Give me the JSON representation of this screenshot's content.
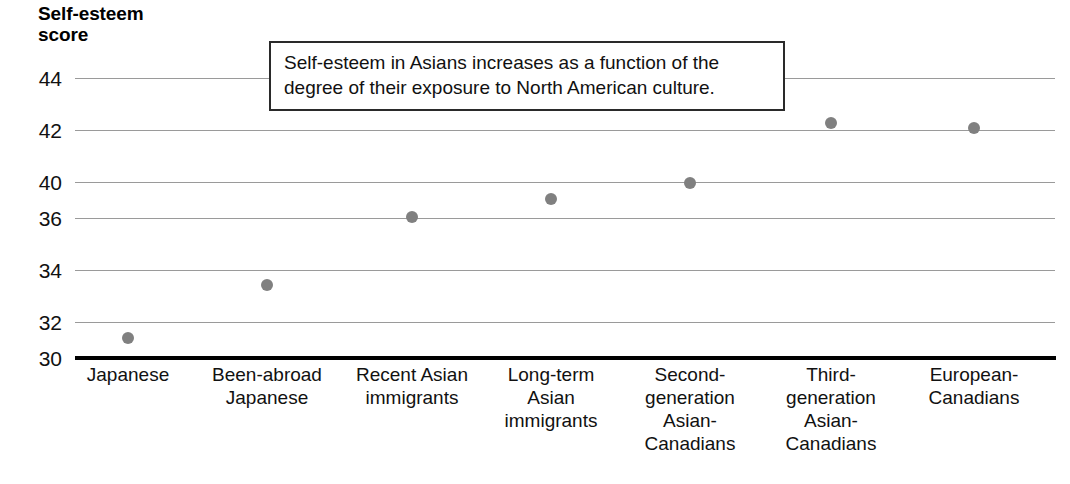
{
  "chart_data": {
    "type": "scatter",
    "title": "",
    "ylabel": "Self-esteem\nscore",
    "xlabel": "",
    "ylim": [
      30,
      44
    ],
    "yticks": [
      "30",
      "32",
      "34",
      "36",
      "40",
      "42",
      "44"
    ],
    "grid": true,
    "legend": null,
    "categories": [
      "Japanese",
      "Been-abroad\nJapanese",
      "Recent Asian\nimmigrants",
      "Long-term\nAsian\nimmigrants",
      "Second-\ngeneration\nAsian-\nCanadians",
      "Third-\ngeneration\nAsian-\nCanadians",
      "European-\nCanadians"
    ],
    "values": [
      31.2,
      33.5,
      36.2,
      38.1,
      39.7,
      42.2,
      42.0
    ],
    "annotations": [
      "Self-esteem in Asians increases as a function of the degree of their exposure to North American culture."
    ],
    "colors": {
      "marker": "#808080",
      "gridline": "#9a9a9a",
      "axis": "#000000",
      "text": "#111111",
      "callout_border": "#2a2a2a",
      "background": "#ffffff"
    }
  },
  "axis": {
    "y_title": "Self-esteem\nscore",
    "ticks": [
      {
        "label": "44",
        "y": 78
      },
      {
        "label": "42",
        "y": 130
      },
      {
        "label": "40",
        "y": 182
      },
      {
        "label": "36",
        "y": 218
      },
      {
        "label": "34",
        "y": 270
      },
      {
        "label": "32",
        "y": 322
      },
      {
        "label": "30",
        "y": 358
      }
    ]
  },
  "points": [
    {
      "label": "Japanese",
      "value": "31.2",
      "x": 128,
      "y": 338
    },
    {
      "label": "Been-abroad Japanese",
      "value": "33.5",
      "x": 267,
      "y": 285
    },
    {
      "label": "Recent Asian immigrants",
      "value": "36.2",
      "x": 412,
      "y": 217
    },
    {
      "label": "Long-term Asian immigrants",
      "value": "38.1",
      "x": 551,
      "y": 199
    },
    {
      "label": "Second-generation Asian-Canadians",
      "value": "39.7",
      "x": 690,
      "y": 183
    },
    {
      "label": "Third-generation Asian-Canadians",
      "value": "42.2",
      "x": 831,
      "y": 123
    },
    {
      "label": "European-Canadians",
      "value": "42.0",
      "x": 974,
      "y": 128
    }
  ],
  "x_categories": [
    {
      "text": "Japanese",
      "center": 128
    },
    {
      "text": "Been-abroad\nJapanese",
      "center": 267
    },
    {
      "text": "Recent Asian\nimmigrants",
      "center": 412
    },
    {
      "text": "Long-term\nAsian\nimmigrants",
      "center": 551
    },
    {
      "text": "Second-\ngeneration\nAsian-\nCanadians",
      "center": 690
    },
    {
      "text": "Third-\ngeneration\nAsian-\nCanadians",
      "center": 831
    },
    {
      "text": "European-\nCanadians",
      "center": 974
    }
  ],
  "callout": {
    "text": "Self-esteem in Asians increases as a function of the degree of their exposure to North American culture."
  }
}
